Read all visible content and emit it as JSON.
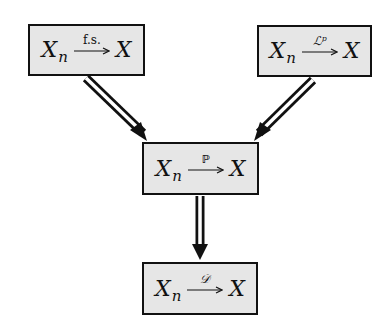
{
  "diagram": {
    "type": "implication-diagram",
    "nodes": [
      {
        "id": "fs",
        "left": "X",
        "left_sub": "n",
        "arrow_label": "f.s.",
        "right": "X",
        "label_style": "roman"
      },
      {
        "id": "lp",
        "left": "X",
        "left_sub": "n",
        "arrow_label": "ℒᵖ",
        "right": "X",
        "label_style": "script"
      },
      {
        "id": "p",
        "left": "X",
        "left_sub": "n",
        "arrow_label": "ℙ",
        "right": "X",
        "label_style": "blackboard"
      },
      {
        "id": "d",
        "left": "X",
        "left_sub": "n",
        "arrow_label": "𝒟",
        "right": "X",
        "label_style": "script"
      }
    ],
    "edges": [
      {
        "from": "fs",
        "to": "p",
        "style": "double-arrow"
      },
      {
        "from": "lp",
        "to": "p",
        "style": "double-arrow"
      },
      {
        "from": "p",
        "to": "d",
        "style": "double-arrow"
      }
    ],
    "colors": {
      "box_fill": "#e6e6e6",
      "stroke": "#111111",
      "background": "#ffffff"
    }
  }
}
